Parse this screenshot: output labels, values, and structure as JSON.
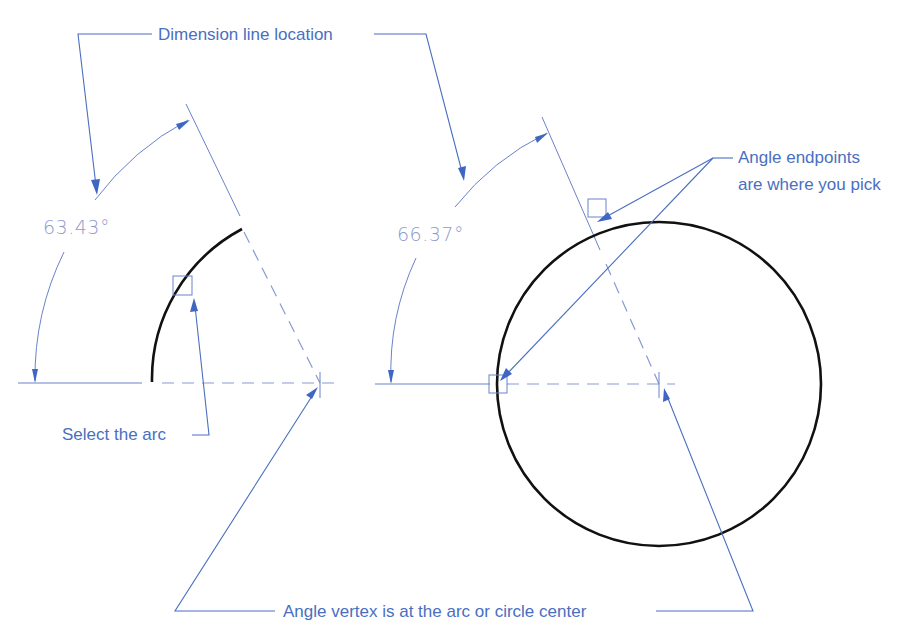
{
  "figure": {
    "labels": {
      "dimension_line_location": "Dimension line location",
      "angle_endpoints_line1": "Angle endpoints",
      "angle_endpoints_line2": "are where you pick",
      "select_the_arc": "Select the arc",
      "angle_vertex": "Angle vertex is at the arc or circle center"
    },
    "left_example": {
      "object": "arc",
      "dimension_value": "63.43°"
    },
    "right_example": {
      "object": "circle",
      "dimension_value": "66.37°"
    },
    "colors": {
      "annotation_blue": "#4a6fc0",
      "dimension_text": "#8d9bcc",
      "object_line": "#111111",
      "background": "#ffffff"
    }
  }
}
